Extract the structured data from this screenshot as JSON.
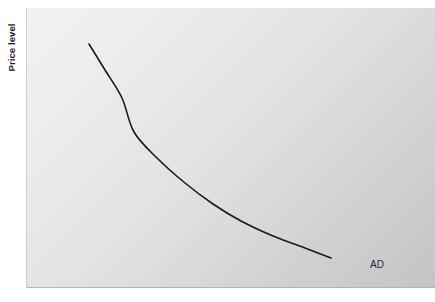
{
  "chart_data": {
    "type": "line",
    "title": "",
    "subtitle": "",
    "xlabel": "",
    "ylabel": "Price level",
    "grid": false,
    "legend": "none",
    "axis_ticks": {
      "x": [],
      "y": []
    },
    "xlim": [
      0,
      409
    ],
    "ylim": [
      0,
      280
    ],
    "annotations": [
      {
        "text": "AD",
        "x": 343,
        "y": 251,
        "name": "aggregate-demand-curve-label"
      }
    ],
    "series": [
      {
        "name": "AD",
        "label": "AD",
        "color": "#1a1a1a",
        "linewidth": 1.6,
        "description": "Downward-sloping aggregate demand curve, convex to the origin",
        "points": [
          {
            "x": 62,
            "y": 36
          },
          {
            "x": 78,
            "y": 62
          },
          {
            "x": 95,
            "y": 90
          },
          {
            "x": 107,
            "y": 124
          },
          {
            "x": 130,
            "y": 150
          },
          {
            "x": 158,
            "y": 175
          },
          {
            "x": 186,
            "y": 196
          },
          {
            "x": 214,
            "y": 213
          },
          {
            "x": 246,
            "y": 228
          },
          {
            "x": 278,
            "y": 240
          },
          {
            "x": 304,
            "y": 250
          }
        ]
      }
    ]
  },
  "figure": {
    "panel_background_light": "#f2f2f2",
    "panel_background_dark": "#c4c4c4",
    "page_background": "#ffffff",
    "curve_color": "#1a1a1a",
    "text_color": "#1b1b1b"
  }
}
